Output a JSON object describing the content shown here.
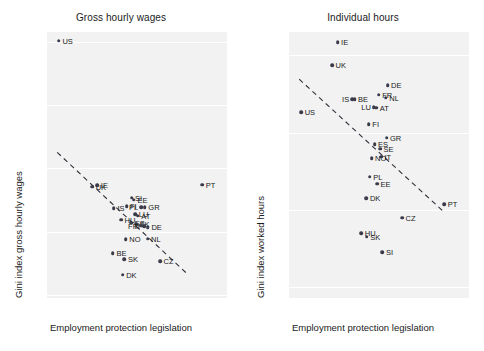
{
  "chart_data": [
    {
      "type": "scatter",
      "title": "Gross hourly wages",
      "xlabel": "Employment protection legislation",
      "ylabel": "Gini index gross hourly wages",
      "xlim": [
        -0.15,
        5.15
      ],
      "ylim": [
        0.195,
        0.615
      ],
      "xticks": [
        0,
        1,
        2,
        3,
        4,
        5
      ],
      "xticklabels": [
        "0",
        "1",
        "2",
        "3",
        "4",
        "5"
      ],
      "yticks": [
        0.2,
        0.3,
        0.4,
        0.5,
        0.6
      ],
      "yticklabels": [
        "0.2",
        "0.3",
        "0.4",
        "0.5",
        "0.6"
      ],
      "grid": "horizontal",
      "legend": "none",
      "fit_line": {
        "style": "dashed",
        "x": [
          0.15,
          4.0
        ],
        "y": [
          0.425,
          0.232
        ]
      },
      "points": [
        {
          "label": "US",
          "x": 0.2,
          "y": 0.601,
          "lp": "right"
        },
        {
          "label": "UK",
          "x": 1.18,
          "y": 0.371,
          "lp": "right"
        },
        {
          "label": "IE",
          "x": 1.33,
          "y": 0.373,
          "lp": "right"
        },
        {
          "label": "SI",
          "x": 2.34,
          "y": 0.353,
          "lp": "right"
        },
        {
          "label": "EE",
          "x": 2.41,
          "y": 0.35,
          "lp": "right"
        },
        {
          "label": "IS",
          "x": 1.82,
          "y": 0.337,
          "lp": "right"
        },
        {
          "label": "FI",
          "x": 2.19,
          "y": 0.34,
          "lp": "right"
        },
        {
          "label": "PL",
          "x": 2.62,
          "y": 0.338,
          "lp": "left"
        },
        {
          "label": "GR",
          "x": 2.73,
          "y": 0.338,
          "lp": "right"
        },
        {
          "label": "LU",
          "x": 2.45,
          "y": 0.327,
          "lp": "right"
        },
        {
          "label": "AT",
          "x": 2.52,
          "y": 0.325,
          "lp": "right"
        },
        {
          "label": "HU",
          "x": 2.03,
          "y": 0.319,
          "lp": "right"
        },
        {
          "label": "ES",
          "x": 2.33,
          "y": 0.314,
          "lp": "right"
        },
        {
          "label": "SK",
          "x": 2.47,
          "y": 0.312,
          "lp": "right"
        },
        {
          "label": "FR",
          "x": 2.62,
          "y": 0.309,
          "lp": "left"
        },
        {
          "label": "IT",
          "x": 2.71,
          "y": 0.308,
          "lp": "left"
        },
        {
          "label": "DE",
          "x": 2.82,
          "y": 0.307,
          "lp": "right"
        },
        {
          "label": "NO",
          "x": 2.17,
          "y": 0.288,
          "lp": "right"
        },
        {
          "label": "NL",
          "x": 2.81,
          "y": 0.289,
          "lp": "right"
        },
        {
          "label": "BE",
          "x": 1.79,
          "y": 0.266,
          "lp": "right"
        },
        {
          "label": "SK",
          "x": 2.13,
          "y": 0.256,
          "lp": "right"
        },
        {
          "label": "CZ",
          "x": 3.18,
          "y": 0.253,
          "lp": "right"
        },
        {
          "label": "DK",
          "x": 2.08,
          "y": 0.232,
          "lp": "right"
        },
        {
          "label": "PT",
          "x": 4.42,
          "y": 0.374,
          "lp": "right"
        }
      ]
    },
    {
      "type": "scatter",
      "title": "Individual hours",
      "xlabel": "Employment protection legislation",
      "ylabel": "Gini index worked hours",
      "xlim": [
        -0.15,
        5.15
      ],
      "ylim": [
        0.043,
        0.215
      ],
      "xticks": [
        0,
        1,
        2,
        3,
        4,
        5
      ],
      "xticklabels": [
        "0",
        "1",
        "2",
        "3",
        "4",
        "5"
      ],
      "yticks": [
        0.05,
        0.1,
        0.15,
        0.2
      ],
      "yticklabels": [
        "0.05",
        "0.1",
        "0.15",
        "0.2"
      ],
      "grid": "horizontal",
      "legend": "none",
      "fit_line": {
        "style": "dashed",
        "x": [
          0.15,
          4.42
        ],
        "y": [
          0.1845,
          0.0985
        ]
      },
      "points": [
        {
          "label": "IE",
          "x": 1.28,
          "y": 0.2085,
          "lp": "right"
        },
        {
          "label": "UK",
          "x": 1.12,
          "y": 0.1935,
          "lp": "right"
        },
        {
          "label": "DE",
          "x": 2.75,
          "y": 0.1805,
          "lp": "right"
        },
        {
          "label": "FR",
          "x": 2.49,
          "y": 0.1745,
          "lp": "right"
        },
        {
          "label": "NL",
          "x": 2.7,
          "y": 0.1725,
          "lp": "right"
        },
        {
          "label": "IS",
          "x": 1.71,
          "y": 0.1715,
          "lp": "left"
        },
        {
          "label": "BE",
          "x": 1.78,
          "y": 0.1715,
          "lp": "right"
        },
        {
          "label": "LU",
          "x": 2.35,
          "y": 0.1665,
          "lp": "left"
        },
        {
          "label": "AT",
          "x": 2.42,
          "y": 0.166,
          "lp": "right"
        },
        {
          "label": "US",
          "x": 0.21,
          "y": 0.163,
          "lp": "right"
        },
        {
          "label": "FI",
          "x": 2.2,
          "y": 0.1555,
          "lp": "right"
        },
        {
          "label": "GR",
          "x": 2.72,
          "y": 0.1465,
          "lp": "right"
        },
        {
          "label": "ES",
          "x": 2.37,
          "y": 0.1425,
          "lp": "right"
        },
        {
          "label": "SE",
          "x": 2.53,
          "y": 0.1395,
          "lp": "right"
        },
        {
          "label": "NO",
          "x": 2.28,
          "y": 0.1335,
          "lp": "right"
        },
        {
          "label": "IT",
          "x": 2.56,
          "y": 0.1345,
          "lp": "right"
        },
        {
          "label": "PL",
          "x": 2.23,
          "y": 0.1215,
          "lp": "right"
        },
        {
          "label": "EE",
          "x": 2.44,
          "y": 0.117,
          "lp": "right"
        },
        {
          "label": "DK",
          "x": 2.13,
          "y": 0.1075,
          "lp": "right"
        },
        {
          "label": "PT",
          "x": 4.42,
          "y": 0.1035,
          "lp": "right"
        },
        {
          "label": "CZ",
          "x": 3.18,
          "y": 0.095,
          "lp": "right"
        },
        {
          "label": "HU",
          "x": 1.98,
          "y": 0.085,
          "lp": "right"
        },
        {
          "label": "SK",
          "x": 2.14,
          "y": 0.0825,
          "lp": "right"
        },
        {
          "label": "SI",
          "x": 2.6,
          "y": 0.0725,
          "lp": "right"
        }
      ]
    }
  ]
}
